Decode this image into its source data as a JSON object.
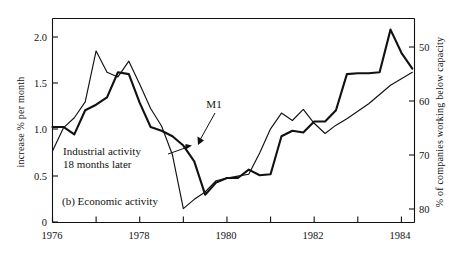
{
  "figure": {
    "caption": "(b)  Economic activity",
    "caption_label": "(b)",
    "caption_title": "Economic activity"
  },
  "chart_data": {
    "type": "line",
    "title": "(b)  Economic activity",
    "xlabel": "",
    "ylabel": "increase % per month",
    "y2label": "% of companies working below capacity",
    "grid": false,
    "legend": "annotations",
    "xlim": [
      1976,
      1984.3
    ],
    "ylim": [
      0,
      2.2
    ],
    "y2lim_inverted": [
      44,
      86
    ],
    "xticks_major": [
      1976,
      1978,
      1980,
      1982,
      1984
    ],
    "xticks_major_labels": [
      "1976",
      "1978",
      "1980",
      "1982",
      "1984"
    ],
    "xticks_minor": [
      1977,
      1979,
      1981,
      1983
    ],
    "yticks": [
      0,
      0.5,
      1.0,
      1.5,
      2.0
    ],
    "ytick_labels": [
      "0",
      "0.5",
      "1.0",
      "1.5",
      "2.0"
    ],
    "y2ticks": [
      50,
      60,
      70,
      80
    ],
    "y2tick_labels": [
      "50",
      "60",
      "70",
      "80"
    ],
    "series": [
      {
        "name": "M1",
        "axis": "left",
        "stroke": "#111111",
        "width": 1.15,
        "x": [
          1976.0,
          1976.25,
          1976.5,
          1976.75,
          1977.0,
          1977.25,
          1977.5,
          1977.75,
          1978.0,
          1978.25,
          1978.5,
          1978.75,
          1979.0,
          1979.25,
          1979.5,
          1979.75,
          1980.0,
          1980.25,
          1980.5,
          1980.75,
          1981.0,
          1981.25,
          1981.5,
          1981.75,
          1982.0,
          1982.25,
          1982.5,
          1982.75,
          1983.0,
          1983.25,
          1983.5,
          1983.75,
          1984.0,
          1984.25
        ],
        "values": [
          0.77,
          1.02,
          1.13,
          1.3,
          1.85,
          1.62,
          1.57,
          1.74,
          1.49,
          1.23,
          1.04,
          0.73,
          0.15,
          0.25,
          0.33,
          0.45,
          0.48,
          0.5,
          0.52,
          0.75,
          1.01,
          1.18,
          1.1,
          1.22,
          1.07,
          0.96,
          1.05,
          1.12,
          1.2,
          1.28,
          1.38,
          1.48,
          1.55,
          1.62
        ]
      },
      {
        "name": "Industrial activity 18 months later",
        "axis": "right",
        "stroke": "#111111",
        "width": 2.1,
        "x": [
          1976.0,
          1976.25,
          1976.5,
          1976.75,
          1977.0,
          1977.25,
          1977.5,
          1977.75,
          1978.0,
          1978.25,
          1978.5,
          1978.75,
          1979.0,
          1979.25,
          1979.5,
          1979.75,
          1980.0,
          1980.25,
          1980.5,
          1980.75,
          1981.0,
          1981.25,
          1981.5,
          1981.75,
          1982.0,
          1982.25,
          1982.5,
          1982.75,
          1983.0,
          1983.25,
          1983.5,
          1983.75,
          1984.0,
          1984.25
        ],
        "values_left_equiv": [
          1.03,
          1.03,
          0.95,
          1.21,
          1.27,
          1.35,
          1.62,
          1.6,
          1.29,
          1.03,
          0.99,
          0.93,
          0.83,
          0.66,
          0.3,
          0.43,
          0.48,
          0.48,
          0.57,
          0.51,
          0.52,
          0.93,
          0.99,
          0.97,
          1.09,
          1.09,
          1.21,
          1.6,
          1.61,
          1.61,
          1.62,
          2.08,
          1.83,
          1.66
        ],
        "values": [
          72.5,
          72.5,
          73.8,
          69.7,
          68.7,
          67.4,
          63.1,
          63.5,
          68.4,
          72.5,
          73.2,
          74.1,
          75.8,
          78.4,
          85.1,
          82.9,
          82.1,
          82.1,
          80.6,
          81.6,
          81.4,
          74.7,
          73.7,
          74.1,
          72.1,
          72.1,
          70.2,
          63.9,
          63.7,
          63.7,
          63.5,
          56.0,
          60.0,
          62.7
        ]
      }
    ],
    "annotations": [
      {
        "text": "M1",
        "x_px": 214,
        "y_px": 104,
        "arrow_from": [
          220,
          112
        ],
        "arrow_to": [
          198,
          143
        ]
      },
      {
        "text_line1": "Industrial activity",
        "text_line2": "18 months later",
        "x_px": 62,
        "y_px": 158,
        "arrow_from": [
          170,
          155
        ],
        "arrow_to": [
          190,
          148
        ]
      }
    ]
  }
}
